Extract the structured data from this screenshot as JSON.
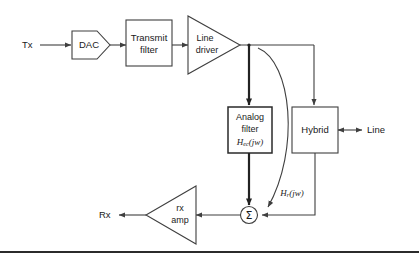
{
  "diagram": {
    "blocks": {
      "dac": {
        "label": "DAC",
        "shape": "pentagon"
      },
      "transmit_filter": {
        "line1": "Transmit",
        "line2": "filter",
        "shape": "rectangle"
      },
      "line_driver": {
        "line1": "Line",
        "line2": "driver",
        "shape": "triangle-right"
      },
      "analog_filter": {
        "line1": "Analog",
        "line2": "filter",
        "formula_base": "H",
        "formula_sub": "ec",
        "formula_rest": "(jw)",
        "shape": "rectangle"
      },
      "hybrid": {
        "label": "Hybrid",
        "shape": "rectangle"
      },
      "rx_amp": {
        "line1": "rx",
        "line2": "amp",
        "shape": "triangle-left"
      },
      "summer": {
        "label": "Σ",
        "shape": "circle"
      }
    },
    "ports": {
      "tx": "Tx",
      "rx": "Rx",
      "line": "Line"
    },
    "annotations": {
      "echo_path": {
        "formula_base": "H",
        "formula_sub": "r",
        "formula_rest": "(jw)"
      }
    },
    "colors": {
      "stroke": "#3f3f3f",
      "stroke_thick": "#222222",
      "text": "#1a1a1a",
      "background": "#ffffff",
      "footer_rule": "#2b2b2b"
    }
  }
}
